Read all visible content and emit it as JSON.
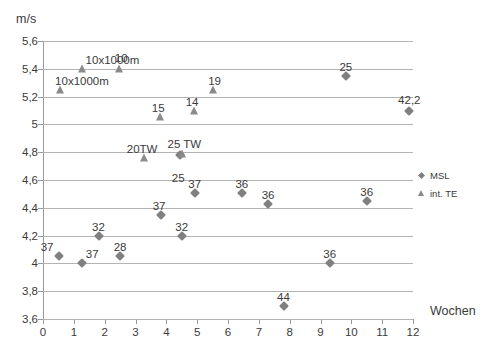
{
  "chart_data": {
    "type": "scatter",
    "title": "",
    "xlabel": "Wochen",
    "ylabel": "m/s",
    "xlim": [
      0,
      12
    ],
    "ylim": [
      3.6,
      5.6
    ],
    "xticks": [
      0,
      1,
      2,
      3,
      4,
      5,
      6,
      7,
      8,
      9,
      10,
      11,
      12
    ],
    "xtick_labels": [
      "0",
      "1",
      "2",
      "3",
      "4",
      "5",
      "6",
      "7",
      "8",
      "9",
      "10",
      "11",
      "12"
    ],
    "yticks": [
      3.6,
      3.8,
      4.0,
      4.2,
      4.4,
      4.6,
      4.8,
      5.0,
      5.2,
      5.4,
      5.6
    ],
    "ytick_labels": [
      "3,6",
      "3,8",
      "4",
      "4,2",
      "4,4",
      "4,6",
      "4,8",
      "5",
      "5,2",
      "5,4",
      "5,6"
    ],
    "grid": true,
    "legend_position": "right",
    "series": [
      {
        "name": "MSL",
        "marker": "diamond",
        "color": "#808080",
        "points": [
          {
            "x": 0.52,
            "y": 4.05,
            "label": "37",
            "label_dx": -12,
            "label_dy": -15
          },
          {
            "x": 1.27,
            "y": 4.0,
            "label": "37",
            "label_dx": 10,
            "label_dy": -15
          },
          {
            "x": 1.8,
            "y": 4.2,
            "label": "32",
            "label_dx": 0,
            "label_dy": -15
          },
          {
            "x": 2.5,
            "y": 4.05,
            "label": "28",
            "label_dx": 0,
            "label_dy": -15
          },
          {
            "x": 3.83,
            "y": 4.35,
            "label": "37",
            "label_dx": -2,
            "label_dy": -15
          },
          {
            "x": 4.45,
            "y": 4.78,
            "label": "25",
            "label_dx": -2,
            "label_dy": 17
          },
          {
            "x": 4.5,
            "y": 4.2,
            "label": "32",
            "label_dx": 0,
            "label_dy": -15
          },
          {
            "x": 4.92,
            "y": 4.51,
            "label": "37",
            "label_dx": 0,
            "label_dy": -15
          },
          {
            "x": 6.45,
            "y": 4.51,
            "label": "36",
            "label_dx": 0,
            "label_dy": -15
          },
          {
            "x": 7.3,
            "y": 4.43,
            "label": "36",
            "label_dx": 0,
            "label_dy": -15
          },
          {
            "x": 7.8,
            "y": 3.69,
            "label": "44",
            "label_dx": 0,
            "label_dy": -15
          },
          {
            "x": 9.3,
            "y": 4.0,
            "label": "36",
            "label_dx": 0,
            "label_dy": -15
          },
          {
            "x": 9.82,
            "y": 5.35,
            "label": "25",
            "label_dx": 0,
            "label_dy": -15
          },
          {
            "x": 10.5,
            "y": 4.45,
            "label": "36",
            "label_dx": 0,
            "label_dy": -15
          },
          {
            "x": 11.88,
            "y": 5.1,
            "label": "42,2",
            "label_dx": 0,
            "label_dy": -17
          }
        ]
      },
      {
        "name": "int. TE",
        "marker": "triangle",
        "color": "#8a8a8a",
        "points": [
          {
            "x": 0.55,
            "y": 5.25,
            "label": "10x1000m",
            "label_dx": 22,
            "label_dy": -15
          },
          {
            "x": 1.28,
            "y": 5.4,
            "label": "10x1000m",
            "label_dx": 30,
            "label_dy": -15
          },
          {
            "x": 2.47,
            "y": 5.4,
            "label": "10",
            "label_dx": 2,
            "label_dy": -17
          },
          {
            "x": 3.28,
            "y": 4.76,
            "label": "20TW",
            "label_dx": -2,
            "label_dy": -15
          },
          {
            "x": 4.52,
            "y": 4.79,
            "label": "25 TW",
            "label_dx": 2,
            "label_dy": -16
          },
          {
            "x": 3.8,
            "y": 5.05,
            "label": "15",
            "label_dx": -2,
            "label_dy": -15
          },
          {
            "x": 4.9,
            "y": 5.1,
            "label": "14",
            "label_dx": -2,
            "label_dy": -15
          },
          {
            "x": 5.5,
            "y": 5.25,
            "label": "19",
            "label_dx": 2,
            "label_dy": -15
          }
        ]
      }
    ],
    "legend_items": [
      {
        "label": "MSL",
        "marker": "diamond"
      },
      {
        "label": "int. TE",
        "marker": "triangle"
      }
    ]
  }
}
